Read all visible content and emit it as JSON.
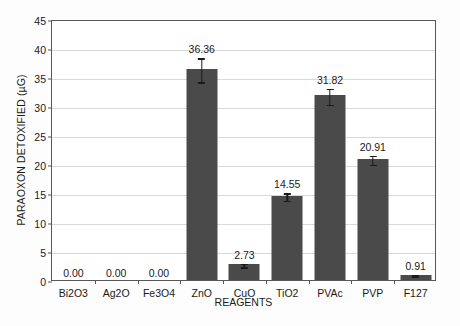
{
  "chart_data": {
    "type": "bar",
    "title": "",
    "xlabel": "REAGENTS",
    "ylabel": "PARAOXON DETOXIFIED (µG)",
    "categories": [
      "Bi2O3",
      "Ag2O",
      "Fe3O4",
      "ZnO",
      "CuO",
      "TiO2",
      "PVAc",
      "PVP",
      "F127"
    ],
    "values": [
      0.0,
      0.0,
      0.0,
      36.36,
      2.73,
      14.55,
      31.82,
      20.91,
      0.91
    ],
    "value_labels": [
      "0.00",
      "0.00",
      "0.00",
      "36.36",
      "2.73",
      "14.55",
      "31.82",
      "20.91",
      "0.91"
    ],
    "errors": [
      0.0,
      0.0,
      0.0,
      2.2,
      0.45,
      0.75,
      1.5,
      0.9,
      0.25
    ],
    "ylim": [
      0,
      45
    ],
    "yticks": [
      0,
      5,
      10,
      15,
      20,
      25,
      30,
      35,
      40,
      45
    ],
    "ytick_labels": [
      "0",
      "5",
      "10",
      "15",
      "20",
      "25",
      "30",
      "35",
      "40",
      "45"
    ],
    "grid": true,
    "legend": "none",
    "bar_color": "#4a4a4a",
    "grid_color": "#d9d9d9",
    "frame_color": "#585858",
    "text_color": "#1a1a1a",
    "background": "#ffffff"
  }
}
